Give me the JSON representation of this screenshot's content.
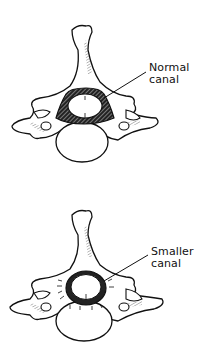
{
  "diagram": {
    "panels": [
      {
        "id": "normal",
        "label_line1": "Normal",
        "label_line2": "canal"
      },
      {
        "id": "smaller",
        "label_line1": "Smaller",
        "label_line2": "canal"
      }
    ]
  },
  "colors": {
    "ink": "#111111",
    "background": "#ffffff"
  }
}
